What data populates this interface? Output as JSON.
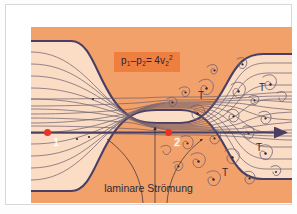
{
  "figure": {
    "kind": "fluid-flow-diagram",
    "caption": "laminare Strömung",
    "formula": {
      "lhs_p1": "p",
      "lhs_p1_sub": "1",
      "minus": "–",
      "lhs_p2": "p",
      "lhs_p2_sub": "2",
      "equals": "=",
      "rhs_coeff": "4v",
      "rhs_sub": "2",
      "rhs_sup": "2",
      "plain": "p1 – p2 = 4v2²"
    },
    "points": [
      {
        "id": "point-1",
        "label": "1",
        "x": 34,
        "y": 121,
        "marker_color": "#e8332a"
      },
      {
        "id": "point-2",
        "label": "2",
        "x": 155,
        "y": 121,
        "marker_color": "#e8332a"
      }
    ],
    "turbulence_labels": [
      {
        "label": "T",
        "x": 185,
        "y": 84
      },
      {
        "label": "T",
        "x": 246,
        "y": 76
      },
      {
        "label": "T",
        "x": 243,
        "y": 136
      },
      {
        "label": "T",
        "x": 209,
        "y": 161
      }
    ],
    "colors": {
      "wall_fill": "#f3a16a",
      "channel_fill": "#fbdcc4",
      "wall_stroke": "#4a3f63",
      "streamline": "#6b6070",
      "eddy": "#6b6070",
      "axis": "#4a3f63",
      "formula_bg": "#ef7f3f",
      "formula_text": "#2b2340",
      "marker": "#e8332a",
      "mat": "#ffffff",
      "page": "#fdfdfd",
      "rule": "#d8d8d8"
    }
  }
}
